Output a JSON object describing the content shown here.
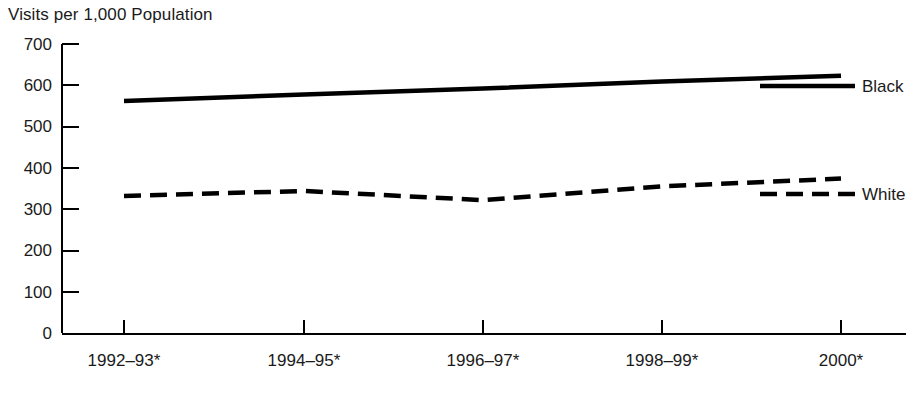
{
  "chart_data": {
    "type": "line",
    "title": "",
    "ylabel": "Visits per 1,000 Population",
    "xlabel": "",
    "categories": [
      "1992–93*",
      "1994–95*",
      "1996–97*",
      "1998–99*",
      "2000*"
    ],
    "yticks": [
      "0",
      "100",
      "200",
      "300",
      "400",
      "500",
      "600",
      "700"
    ],
    "ylim": [
      0,
      700
    ],
    "grid": false,
    "legend_position": "right-inline",
    "series": [
      {
        "name": "Black",
        "style": "solid",
        "color": "#000000",
        "values": [
          562,
          578,
          592,
          609,
          623
        ]
      },
      {
        "name": "White",
        "style": "dashed",
        "color": "#000000",
        "values": [
          332,
          344,
          322,
          355,
          374
        ]
      }
    ]
  },
  "axis": {
    "y_title": "Visits per 1,000 Population"
  },
  "legend": {
    "black_label": "Black",
    "white_label": "White"
  }
}
